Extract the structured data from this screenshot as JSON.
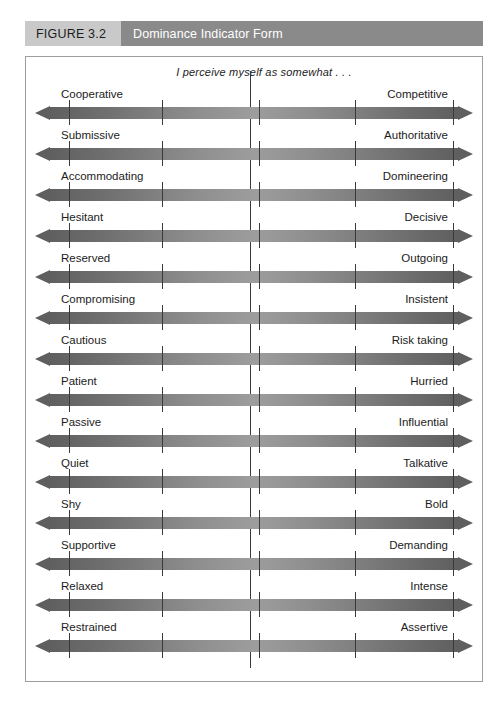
{
  "header": {
    "figure_number": "FIGURE 3.2",
    "figure_title": "Dominance Indicator Form",
    "number_bg": "#c9c9c9",
    "title_bg": "#8a8a8a",
    "title_color": "#ffffff"
  },
  "form": {
    "caption": "I perceive myself as somewhat . . .",
    "scale_points": 5,
    "arrow_gradient_dark": "#5f5f5f",
    "arrow_gradient_light": "#9d9d9d",
    "tick_color": "#3a3a3a",
    "border_color": "#9d9d9d",
    "rows": [
      {
        "left": "Cooperative",
        "right": "Competitive"
      },
      {
        "left": "Submissive",
        "right": "Authoritative"
      },
      {
        "left": "Accommodating",
        "right": "Domineering"
      },
      {
        "left": "Hesitant",
        "right": "Decisive"
      },
      {
        "left": "Reserved",
        "right": "Outgoing"
      },
      {
        "left": "Compromising",
        "right": "Insistent"
      },
      {
        "left": "Cautious",
        "right": "Risk taking"
      },
      {
        "left": "Patient",
        "right": "Hurried"
      },
      {
        "left": "Passive",
        "right": "Influential"
      },
      {
        "left": "Quiet",
        "right": "Talkative"
      },
      {
        "left": "Shy",
        "right": "Bold"
      },
      {
        "left": "Supportive",
        "right": "Demanding"
      },
      {
        "left": "Relaxed",
        "right": "Intense"
      },
      {
        "left": "Restrained",
        "right": "Assertive"
      }
    ]
  }
}
